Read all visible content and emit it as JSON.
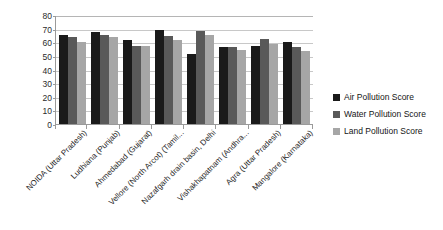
{
  "chart_data": {
    "type": "bar",
    "title": "",
    "xlabel": "",
    "ylabel": "",
    "ylim": [
      0,
      80
    ],
    "ytick_step": 10,
    "yticks": [
      "80",
      "70",
      "60",
      "50",
      "40",
      "30",
      "20",
      "10",
      "0"
    ],
    "grid": true,
    "legend_position": "right",
    "categories": [
      "NOIDA (Uttar Pradesh)",
      "Ludhiana (Punjab)",
      "Ahmedabad (Gujarat)",
      "Vellore (North Arcot) (Tamil...",
      "Nazafgarh drain basin, Delhi",
      "Vishakhapatnam (Andhra...",
      "Agra (Uttar Pradesh)",
      "Mangalore (Karnataka)"
    ],
    "series": [
      {
        "name": "Air Pollution Score",
        "color": "#1a1a1a",
        "values": [
          65.5,
          67.5,
          62,
          69,
          51.5,
          56.5,
          57.5,
          60.5
        ]
      },
      {
        "name": "Water Pollution Score",
        "color": "#595959",
        "values": [
          63.5,
          65.5,
          57.5,
          64.5,
          68.5,
          56.5,
          62.5,
          56.5
        ]
      },
      {
        "name": "Land Pollution Score",
        "color": "#a6a6a6",
        "values": [
          60,
          64,
          57.5,
          62,
          65,
          54,
          59,
          53.5
        ]
      }
    ]
  },
  "legend": {
    "items": [
      {
        "label": "Air Pollution Score"
      },
      {
        "label": "Water Pollution Score"
      },
      {
        "label": "Land Pollution Score"
      }
    ]
  }
}
